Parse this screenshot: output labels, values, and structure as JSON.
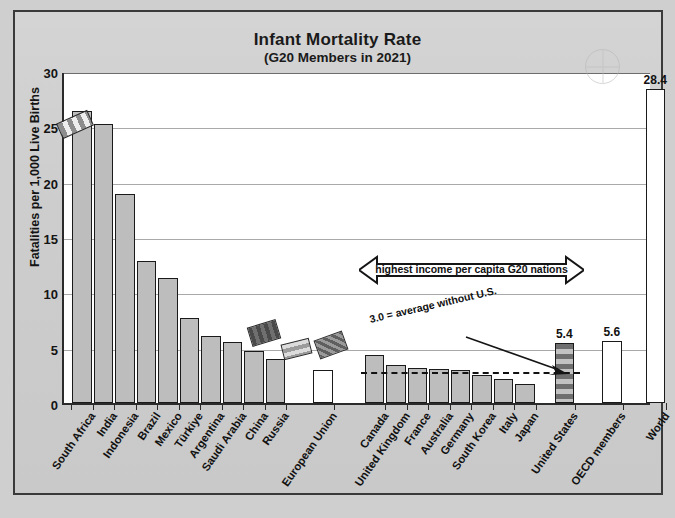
{
  "chart_data": {
    "type": "bar",
    "title": "Infant Mortality Rate",
    "subtitle": "(G20 Members in 2021)",
    "xlabel": "",
    "ylabel": "Fatalities per 1,000 Live Births",
    "ylim": [
      0,
      30
    ],
    "yticks": [
      0,
      5,
      10,
      15,
      20,
      25,
      30
    ],
    "grid": true,
    "legend": "none",
    "categories": [
      "South Africa",
      "India",
      "Indonesia",
      "Brazil",
      "Mexico",
      "Türkiye",
      "Argentina",
      "Saudi Arabia",
      "China",
      "Russia",
      "European Union",
      "Canada",
      "United Kingdom",
      "France",
      "Australia",
      "Germany",
      "South Korea",
      "Italy",
      "Japan",
      "United States",
      "OECD members",
      "World"
    ],
    "values": [
      26.4,
      25.2,
      18.9,
      12.8,
      11.3,
      7.7,
      6.1,
      5.5,
      4.7,
      4.0,
      3.0,
      4.3,
      3.4,
      3.2,
      3.1,
      3.0,
      2.5,
      2.2,
      1.7,
      5.4,
      5.6,
      28.4
    ],
    "value_labels": {
      "United States": "5.4",
      "OECD members": "5.6",
      "World": "28.4"
    },
    "bar_styles": {
      "South Africa": "gray",
      "India": "gray",
      "Indonesia": "gray",
      "Brazil": "gray",
      "Mexico": "gray",
      "Türkiye": "gray",
      "Argentina": "gray",
      "Saudi Arabia": "gray",
      "China": "gray",
      "Russia": "gray",
      "European Union": "white",
      "Canada": "gray",
      "United Kingdom": "gray",
      "France": "gray",
      "Australia": "gray",
      "Germany": "gray",
      "South Korea": "gray",
      "Italy": "gray",
      "Japan": "gray",
      "United States": "usa",
      "OECD members": "white",
      "World": "white"
    },
    "reference_line": {
      "value": 3.0,
      "label": "3.0 = average without U.S.",
      "style": "dashed"
    },
    "annotations": [
      {
        "label": "highest income per capita G20 nations",
        "type": "double-arrow",
        "spans": [
          "Canada",
          "Japan"
        ]
      }
    ]
  }
}
